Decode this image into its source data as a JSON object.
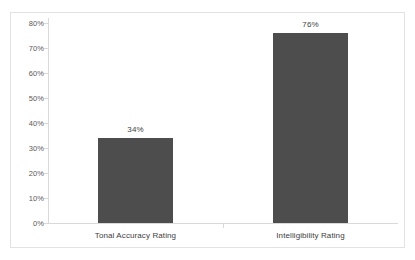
{
  "chart_data": {
    "type": "bar",
    "title": "",
    "subtitle": "",
    "xlabel": "",
    "ylabel": "",
    "categories": [
      "Tonal Accuracy Rating",
      "Intelligibility Rating"
    ],
    "values": [
      34,
      76
    ],
    "value_labels": [
      "34%",
      "76%"
    ],
    "ylim": [
      0,
      80
    ],
    "y_tick_step": 10,
    "y_tick_labels": [
      "80%",
      "70%",
      "60%",
      "50%",
      "40%",
      "30%",
      "20%",
      "10%",
      "0%"
    ],
    "y_tick_values": [
      80,
      70,
      60,
      50,
      40,
      30,
      20,
      10,
      0
    ],
    "grid": false,
    "legend": false,
    "legend_position": "none",
    "series": [
      {
        "name": "",
        "values": [
          34,
          76
        ]
      }
    ],
    "colors": {
      "bar": "#4d4d4d",
      "axis": "#d9d9d9",
      "frame": "#e2e2e2",
      "tick_text": "#595959",
      "label_text": "#404040",
      "background": "#ffffff"
    }
  }
}
